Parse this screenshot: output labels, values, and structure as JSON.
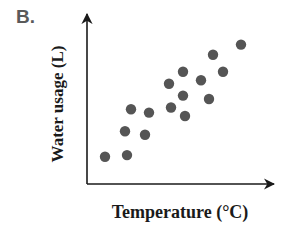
{
  "panel": {
    "label": "B."
  },
  "chart_data": {
    "type": "scatter",
    "title": "",
    "xlabel": "Temperature (°C)",
    "ylabel": "Water usage (L)",
    "xlim": [
      0,
      100
    ],
    "ylim": [
      0,
      100
    ],
    "grid": false,
    "legend": null,
    "ticks": "none",
    "axes_style": "arrows",
    "marker_color": "#555555",
    "points": [
      {
        "x": 9,
        "y": 16
      },
      {
        "x": 20,
        "y": 17
      },
      {
        "x": 19,
        "y": 31
      },
      {
        "x": 29,
        "y": 29
      },
      {
        "x": 22,
        "y": 44
      },
      {
        "x": 31,
        "y": 42
      },
      {
        "x": 42,
        "y": 45
      },
      {
        "x": 49,
        "y": 40
      },
      {
        "x": 41,
        "y": 59
      },
      {
        "x": 48,
        "y": 52
      },
      {
        "x": 48,
        "y": 66
      },
      {
        "x": 57,
        "y": 61
      },
      {
        "x": 61,
        "y": 50
      },
      {
        "x": 63,
        "y": 76
      },
      {
        "x": 68,
        "y": 66
      },
      {
        "x": 77,
        "y": 82
      }
    ]
  }
}
